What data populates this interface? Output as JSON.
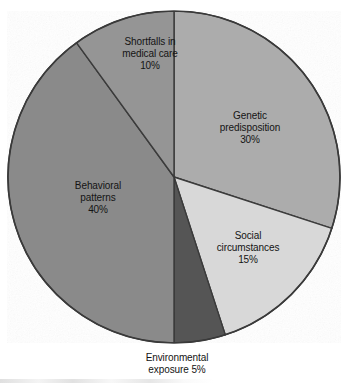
{
  "figure": {
    "background_color": "#ffffff",
    "outline_color": "#3a3a3a"
  },
  "chart_data": {
    "type": "pie",
    "title": "",
    "subtitle": "",
    "xlabel": "",
    "ylabel": "",
    "legend_position": "none",
    "grid": false,
    "labels_inside_slices": true,
    "start_angle_deg": 0,
    "direction": "clockwise",
    "center": {
      "x": 174,
      "y": 177
    },
    "radius": 166,
    "total": 100,
    "units": "%",
    "categories": [
      "Genetic predisposition",
      "Social circumstances",
      "Environmental exposure",
      "Behavioral patterns",
      "Shortfalls in medical care"
    ],
    "values": [
      30,
      15,
      5,
      40,
      10
    ],
    "value_labels": [
      "30%",
      "15%",
      "5%",
      "40%",
      "10%"
    ],
    "colors": [
      "#acacac",
      "#d8d8d8",
      "#555555",
      "#8a8a8a",
      "#959595"
    ],
    "slices": [
      {
        "name": "Genetic predisposition",
        "value": 30,
        "value_label": "30%",
        "color": "#acacac",
        "start_angle_deg": 0,
        "end_angle_deg": 108,
        "label_placement": "inside",
        "label_line1": "Genetic",
        "label_line2": "predisposition"
      },
      {
        "name": "Social circumstances",
        "value": 15,
        "value_label": "15%",
        "color": "#d8d8d8",
        "start_angle_deg": 108,
        "end_angle_deg": 162,
        "label_placement": "inside",
        "label_line1": "Social",
        "label_line2": "circumstances"
      },
      {
        "name": "Environmental exposure",
        "value": 5,
        "value_label": "5%",
        "color": "#555555",
        "start_angle_deg": 162,
        "end_angle_deg": 180,
        "label_placement": "outside-bottom",
        "label_line1": "Environmental",
        "label_line2": "exposure 5%"
      },
      {
        "name": "Behavioral patterns",
        "value": 40,
        "value_label": "40%",
        "color": "#8a8a8a",
        "start_angle_deg": 180,
        "end_angle_deg": 324,
        "label_placement": "inside",
        "label_line1": "Behavioral",
        "label_line2": "patterns"
      },
      {
        "name": "Shortfalls in medical care",
        "value": 10,
        "value_label": "10%",
        "color": "#959595",
        "start_angle_deg": 324,
        "end_angle_deg": 360,
        "label_placement": "inside",
        "label_line1": "Shortfalls in",
        "label_line2": "medical care"
      }
    ]
  },
  "labels": {
    "genetic": {
      "line1": "Genetic",
      "line2": "predisposition",
      "value": "30%"
    },
    "social": {
      "line1": "Social",
      "line2": "circumstances",
      "value": "15%"
    },
    "environmental": {
      "line1": "Environmental",
      "line2": "exposure 5%"
    },
    "behavioral": {
      "line1": "Behavioral",
      "line2": "patterns",
      "value": "40%"
    },
    "shortfalls": {
      "line1": "Shortfalls in",
      "line2": "medical care",
      "value": "10%"
    }
  }
}
